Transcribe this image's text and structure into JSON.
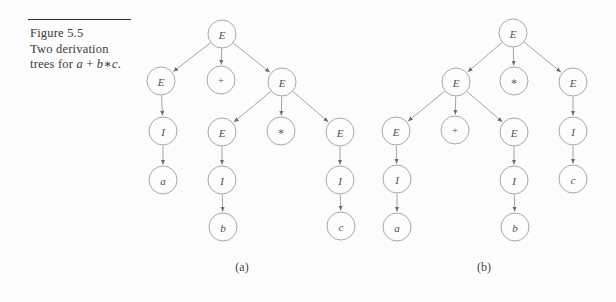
{
  "figure": {
    "label": "Figure 5.5",
    "caption_lines": [
      [
        {
          "text": "Two derivation",
          "italic": false
        }
      ],
      [
        {
          "text": "trees for ",
          "italic": false
        },
        {
          "text": "a",
          "italic": true
        },
        {
          "text": " + ",
          "italic": false
        },
        {
          "text": "b",
          "italic": true
        },
        {
          "text": "∗",
          "italic": false
        },
        {
          "text": "c",
          "italic": true
        },
        {
          "text": ".",
          "italic": false
        }
      ]
    ]
  },
  "colors": {
    "background": "#fcfcfc",
    "rule": "#2e2e2e",
    "caption_text": "#3a3a3a",
    "circle_stroke": "#9d9d9d",
    "circle_fill": "#fcfcfc",
    "edge_stroke": "#8e8e8e",
    "arrowhead": "#6d6d6d",
    "node_text": "#4f4f4f",
    "sublabel_text": "#454545"
  },
  "geometry": {
    "node_radius": 14
  },
  "trees": [
    {
      "id": "a",
      "sublabel": "(a)",
      "sublabel_pos": {
        "x": 242,
        "y": 271
      },
      "nodes": [
        {
          "id": "a0",
          "label": "E",
          "italic": true,
          "x": 222,
          "y": 34
        },
        {
          "id": "a1",
          "label": "E",
          "italic": true,
          "x": 161,
          "y": 81
        },
        {
          "id": "a2",
          "label": "+",
          "italic": false,
          "x": 221,
          "y": 80
        },
        {
          "id": "a3",
          "label": "E",
          "italic": true,
          "x": 282,
          "y": 82
        },
        {
          "id": "a4",
          "label": "I",
          "italic": true,
          "x": 163,
          "y": 131
        },
        {
          "id": "a5",
          "label": "E",
          "italic": true,
          "x": 222,
          "y": 132
        },
        {
          "id": "a6",
          "label": "∗",
          "italic": false,
          "x": 281,
          "y": 131
        },
        {
          "id": "a7",
          "label": "E",
          "italic": true,
          "x": 340,
          "y": 132
        },
        {
          "id": "a8",
          "label": "a",
          "italic": true,
          "x": 163,
          "y": 180
        },
        {
          "id": "a9",
          "label": "I",
          "italic": true,
          "x": 222,
          "y": 180
        },
        {
          "id": "a10",
          "label": "I",
          "italic": true,
          "x": 340,
          "y": 180
        },
        {
          "id": "a11",
          "label": "b",
          "italic": true,
          "x": 223,
          "y": 227
        },
        {
          "id": "a12",
          "label": "c",
          "italic": true,
          "x": 341,
          "y": 226
        }
      ],
      "edges": [
        [
          "a0",
          "a1"
        ],
        [
          "a0",
          "a2"
        ],
        [
          "a0",
          "a3"
        ],
        [
          "a1",
          "a4"
        ],
        [
          "a4",
          "a8"
        ],
        [
          "a3",
          "a5"
        ],
        [
          "a3",
          "a6"
        ],
        [
          "a3",
          "a7"
        ],
        [
          "a5",
          "a9"
        ],
        [
          "a9",
          "a11"
        ],
        [
          "a7",
          "a10"
        ],
        [
          "a10",
          "a12"
        ]
      ]
    },
    {
      "id": "b",
      "sublabel": "(b)",
      "sublabel_pos": {
        "x": 484,
        "y": 271
      },
      "nodes": [
        {
          "id": "b0",
          "label": "E",
          "italic": true,
          "x": 513,
          "y": 33
        },
        {
          "id": "b1",
          "label": "E",
          "italic": true,
          "x": 456,
          "y": 82
        },
        {
          "id": "b2",
          "label": "∗",
          "italic": false,
          "x": 514,
          "y": 81
        },
        {
          "id": "b3",
          "label": "E",
          "italic": true,
          "x": 573,
          "y": 82
        },
        {
          "id": "b4",
          "label": "E",
          "italic": true,
          "x": 396,
          "y": 131
        },
        {
          "id": "b5",
          "label": "+",
          "italic": false,
          "x": 455,
          "y": 130
        },
        {
          "id": "b6",
          "label": "E",
          "italic": true,
          "x": 514,
          "y": 132
        },
        {
          "id": "b7",
          "label": "I",
          "italic": true,
          "x": 573,
          "y": 131
        },
        {
          "id": "b8",
          "label": "I",
          "italic": true,
          "x": 397,
          "y": 179
        },
        {
          "id": "b9",
          "label": "I",
          "italic": true,
          "x": 514,
          "y": 180
        },
        {
          "id": "b10",
          "label": "c",
          "italic": true,
          "x": 573,
          "y": 179
        },
        {
          "id": "b11",
          "label": "a",
          "italic": true,
          "x": 397,
          "y": 227
        },
        {
          "id": "b12",
          "label": "b",
          "italic": true,
          "x": 515,
          "y": 227
        }
      ],
      "edges": [
        [
          "b0",
          "b1"
        ],
        [
          "b0",
          "b2"
        ],
        [
          "b0",
          "b3"
        ],
        [
          "b1",
          "b4"
        ],
        [
          "b1",
          "b5"
        ],
        [
          "b1",
          "b6"
        ],
        [
          "b3",
          "b7"
        ],
        [
          "b7",
          "b10"
        ],
        [
          "b4",
          "b8"
        ],
        [
          "b8",
          "b11"
        ],
        [
          "b6",
          "b9"
        ],
        [
          "b9",
          "b12"
        ]
      ]
    }
  ]
}
